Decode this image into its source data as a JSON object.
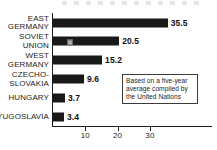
{
  "chart_data": {
    "type": "bar",
    "orientation": "horizontal",
    "title": "",
    "xlabel": "",
    "ylabel": "",
    "xlim": [
      0,
      37
    ],
    "grid": false,
    "legend": "none",
    "categories": [
      "EAST\nGERMANY",
      "SOVIET\nUNION",
      "WEST\nGERMANY",
      "CZECHO-\nSLOVAKIA",
      "HUNGARY",
      "YUGOSLAVIA"
    ],
    "values": [
      35.5,
      20.5,
      15.2,
      9.6,
      3.7,
      3.4
    ],
    "value_labels": [
      "35.5",
      "20.5",
      "15.2",
      "9.6",
      "3.7",
      "3.4"
    ],
    "xticks": [
      10,
      20,
      30
    ],
    "xtick_labels": [
      "10",
      "20",
      "30"
    ],
    "annotation": "Based on a five-year\naverage compiled by\nthe United Nations",
    "bar_color": "#191919",
    "axis_color": "#1a1a1a",
    "text_color": "#1d1d1d",
    "background": "#ffffff"
  }
}
